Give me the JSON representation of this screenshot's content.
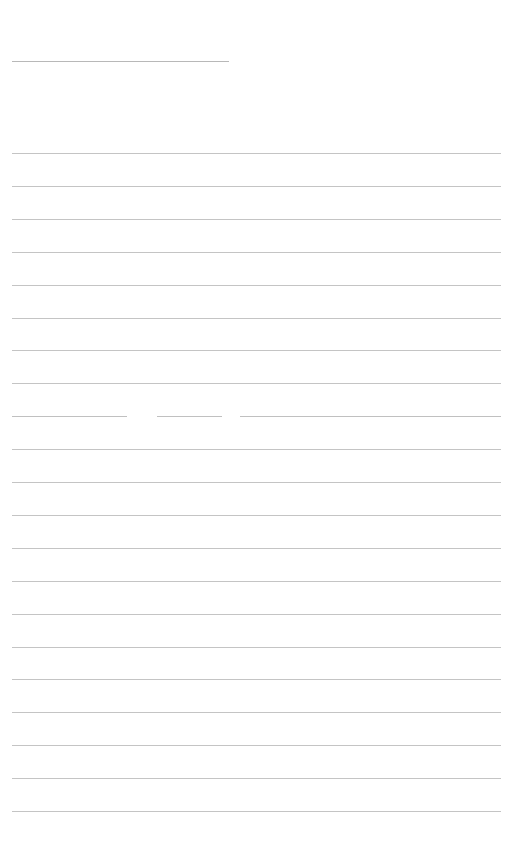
{
  "page": {
    "background": "#ffffff",
    "line_color": "#c4c4c4"
  },
  "title_line": {
    "x1": 12,
    "x2": 229,
    "y": 61
  },
  "ruled_lines": {
    "x1": 12,
    "x2": 501,
    "first_y": 153,
    "spacing": 32.9,
    "count": 21,
    "broken_line_index": 8,
    "broken_segments": [
      {
        "x1": 12,
        "x2": 127
      },
      {
        "x1": 157,
        "x2": 222
      },
      {
        "x1": 240,
        "x2": 501
      }
    ]
  }
}
